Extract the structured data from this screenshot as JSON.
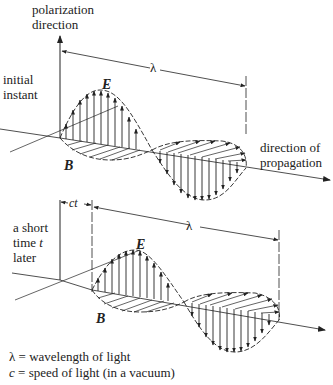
{
  "figure": {
    "top_panel": {
      "axis_label_line1": "polarization",
      "axis_label_line2": "direction",
      "time_label_line1": "initial",
      "time_label_line2": "instant",
      "e_field_symbol": "E",
      "b_field_symbol": "B",
      "wavelength_symbol": "λ",
      "propagation_label_line1": "direction of",
      "propagation_label_line2": "propagation"
    },
    "bottom_panel": {
      "time_label_line1": "a short",
      "time_label_line2_prefix": "time ",
      "time_label_var": "t",
      "time_label_line3": "later",
      "displacement_label": "ct",
      "e_field_symbol": "E",
      "b_field_symbol": "B",
      "wavelength_symbol": "λ"
    },
    "legend": [
      {
        "symbol": "λ",
        "eq": " = ",
        "text": "wavelength of light"
      },
      {
        "symbol": "c",
        "eq": " = ",
        "text": "speed of light (in a vacuum)"
      }
    ]
  }
}
